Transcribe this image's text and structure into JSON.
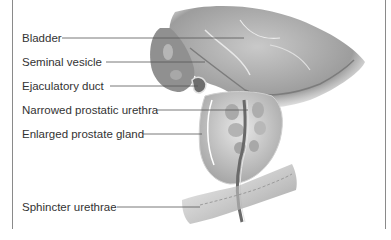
{
  "diagram": {
    "labels": [
      {
        "text": "Bladder",
        "y": 38,
        "line_start": 62,
        "line_end": 244
      },
      {
        "text": "Seminal vesicle",
        "y": 62,
        "line_start": 106,
        "line_end": 205
      },
      {
        "text": "Ejaculatory duct",
        "y": 86,
        "line_start": 110,
        "line_end": 198
      },
      {
        "text": "Narrowed prostatic urethra",
        "y": 110,
        "line_start": 156,
        "line_end": 248
      },
      {
        "text": "Enlarged prostate gland",
        "y": 134,
        "line_start": 143,
        "line_end": 202
      },
      {
        "text": "Sphincter urethrae",
        "y": 207,
        "line_start": 117,
        "line_end": 200
      }
    ],
    "colors": {
      "frame": "#8a8a8a",
      "text": "#333333",
      "leader_line": "#555555",
      "tissue_dark": "#8c8c8c",
      "tissue_mid": "#b5b5b5",
      "tissue_light": "#d9d9d9"
    }
  }
}
